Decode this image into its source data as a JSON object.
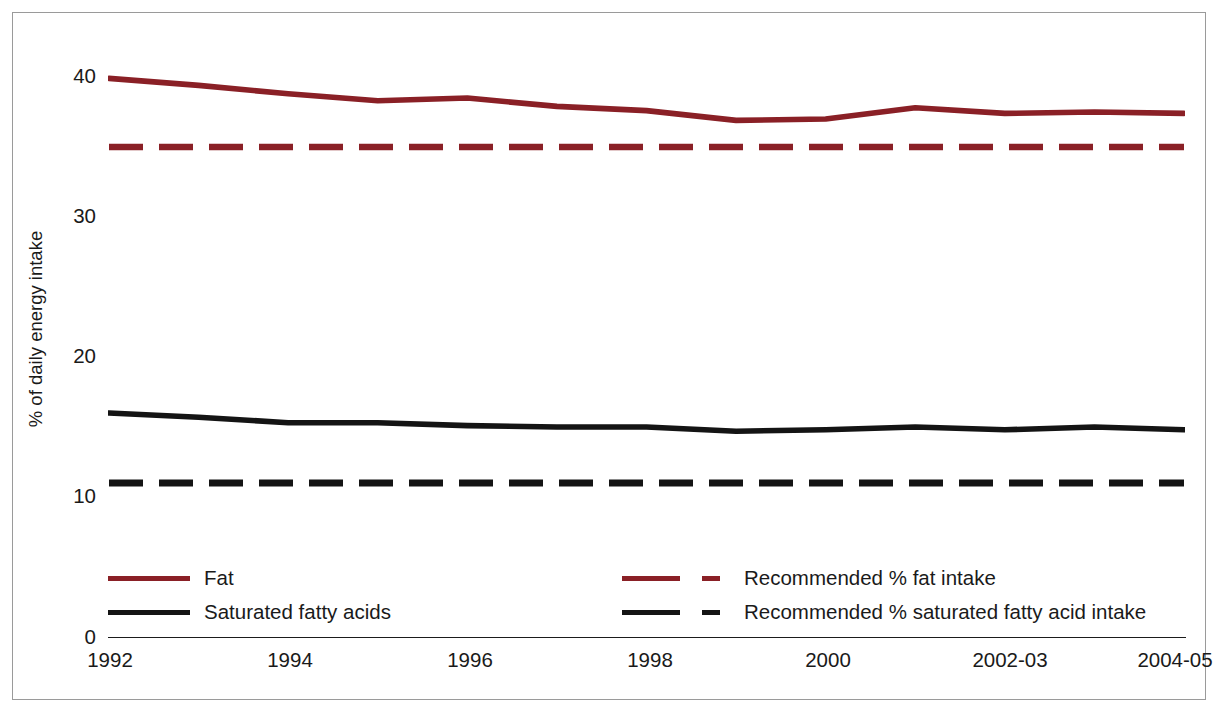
{
  "chart_data": {
    "type": "line",
    "title": "",
    "subtitle": "",
    "xlabel": "",
    "ylabel": "% of daily energy intake",
    "x": [
      1992,
      1993,
      1994,
      1995,
      1996,
      1997,
      1998,
      1999,
      2000,
      2001,
      "2002-03",
      "2003-04",
      "2004-05"
    ],
    "tick_labels": [
      "1992",
      "1994",
      "1996",
      "1998",
      "2000",
      "2002-03",
      "2004-05"
    ],
    "tick_label_positions": [
      1992,
      1994,
      1996,
      1998,
      2000,
      "2002-03",
      "2004-05"
    ],
    "yticks": [
      0,
      10,
      20,
      30,
      40
    ],
    "ylim": [
      0,
      44
    ],
    "grid": false,
    "legend_position": "inside-bottom",
    "series": [
      {
        "name": "Fat",
        "style": "solid",
        "color": "#8a2026",
        "values": [
          39.9,
          39.4,
          38.8,
          38.3,
          38.5,
          37.9,
          37.6,
          36.9,
          37.0,
          37.8,
          37.4,
          37.5,
          37.4
        ]
      },
      {
        "name": "Saturated fatty acids",
        "style": "solid",
        "color": "#141414",
        "values": [
          16.0,
          15.7,
          15.3,
          15.3,
          15.1,
          15.0,
          15.0,
          14.7,
          14.8,
          15.0,
          14.8,
          15.0,
          14.8
        ]
      },
      {
        "name": "Recommended % fat intake",
        "style": "dashed",
        "color": "#8a2026",
        "constant": 35,
        "values": [
          35,
          35,
          35,
          35,
          35,
          35,
          35,
          35,
          35,
          35,
          35,
          35,
          35
        ]
      },
      {
        "name": "Recommended % saturated fatty acid intake",
        "style": "dashed",
        "color": "#141414",
        "constant": 11,
        "values": [
          11,
          11,
          11,
          11,
          11,
          11,
          11,
          11,
          11,
          11,
          11,
          11,
          11
        ]
      }
    ]
  },
  "axis": {
    "y_title": "% of daily energy intake",
    "y_ticks": [
      "40",
      "30",
      "20",
      "10",
      "0"
    ],
    "x_ticks": [
      "1992",
      "1994",
      "1996",
      "1998",
      "2000",
      "2002-03",
      "2004-05"
    ]
  },
  "legend": {
    "entries": [
      {
        "label": "Fat",
        "style": "solid",
        "color": "#8a2026"
      },
      {
        "label": "Saturated fatty acids",
        "style": "solid",
        "color": "#141414"
      },
      {
        "label": "Recommended % fat intake",
        "style": "dashed",
        "color": "#8a2026"
      },
      {
        "label": "Recommended % saturated fatty acid intake",
        "style": "dashed",
        "color": "#141414"
      }
    ]
  },
  "colors": {
    "fat": "#8a2026",
    "saturated": "#141414",
    "axis": "#1b1b1b",
    "frame": "#9a9a9a",
    "background": "#ffffff"
  }
}
